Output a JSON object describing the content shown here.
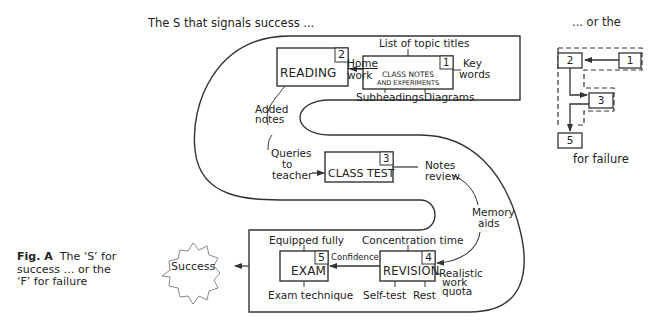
{
  "header": {
    "success_title": "The S that signals success ...",
    "failure_title": "... or the",
    "failure_subtitle": "for failure"
  },
  "caption": {
    "label": "Fig. A",
    "text": "The ‘S’ for success … or the ‘F’ for failure"
  },
  "s_path": {
    "stages": [
      {
        "number": "1",
        "label_line1": "CLASS NOTES",
        "label_line2": "AND EXPERIMENTS"
      },
      {
        "number": "2",
        "label": "READING"
      },
      {
        "number": "3",
        "label": "CLASS TEST"
      },
      {
        "number": "4",
        "label": "REVISION"
      },
      {
        "number": "5",
        "label": "EXAM"
      }
    ],
    "annotations": {
      "list_of_topic_titles": "List of topic titles",
      "key_words": [
        "Key",
        "words"
      ],
      "subheadings": "Subheadings",
      "diagrams": "Diagrams",
      "homework": [
        "Home",
        "work"
      ],
      "added_notes": [
        "Added",
        "notes"
      ],
      "queries_to_teacher": [
        "Queries",
        "to",
        "teacher"
      ],
      "notes_review": [
        "Notes",
        "review"
      ],
      "memory_aids": [
        "Memory",
        "aids"
      ],
      "concentration_time": "Concentration time",
      "realistic_work_quota": [
        "Realistic",
        "work",
        "quota"
      ],
      "self_test": "Self-test",
      "rest": "Rest",
      "confidence": "Confidence",
      "equipped_fully": "Equipped fully",
      "exam_technique": "Exam technique"
    },
    "outcome": "Success"
  },
  "f_path": {
    "stages": [
      "1",
      "2",
      "3",
      "5"
    ]
  }
}
